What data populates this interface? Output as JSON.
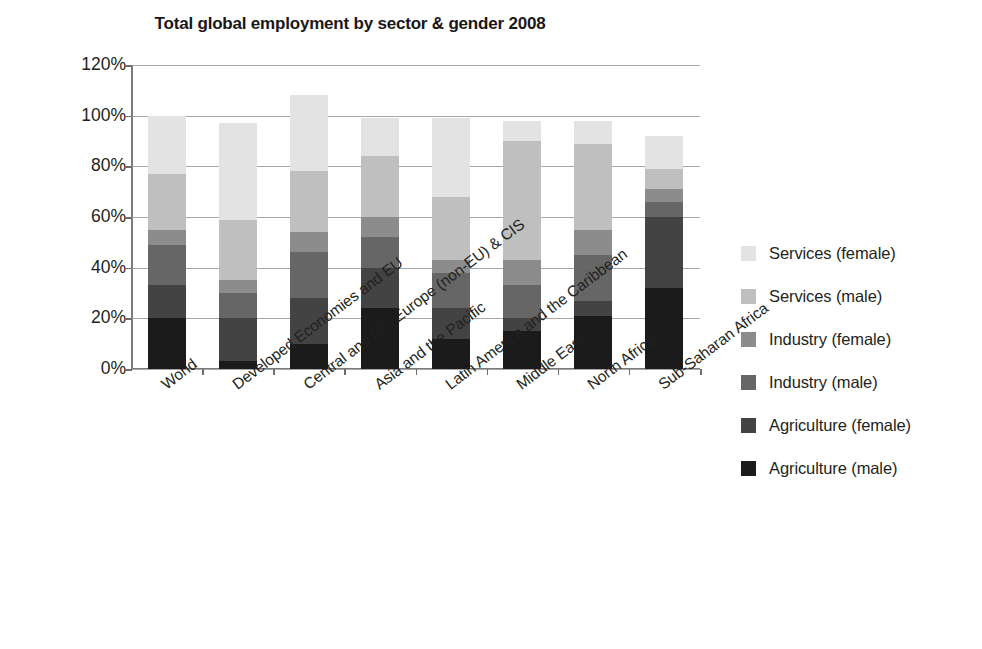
{
  "chart_data": {
    "type": "bar",
    "subtype": "stacked-bar-percent",
    "title": "Total global employment by sector & gender 2008",
    "xlabel": "",
    "ylabel": "",
    "ylim": [
      0,
      120
    ],
    "ytick_labels": [
      "0%",
      "20%",
      "40%",
      "60%",
      "80%",
      "100%",
      "120%"
    ],
    "ytick_values": [
      0,
      20,
      40,
      60,
      80,
      100,
      120
    ],
    "grid": true,
    "legend_position": "right",
    "stack_order_bottom_to_top": [
      "Agriculture (male)",
      "Agriculture (female)",
      "Industry (male)",
      "Industry (female)",
      "Services (male)",
      "Services (female)"
    ],
    "categories": [
      "World",
      "Developed Economies and EU",
      "Central and SE. Europe (non-EU) & CIS",
      "Asia and the Pacific",
      "Latin America and the Caribbean",
      "Middle East",
      "North Africa",
      "Sub-Saharan Africa"
    ],
    "series": [
      {
        "name": "Services (female)",
        "color": "#e3e3e3",
        "values": [
          23,
          38,
          30,
          15,
          31,
          8,
          9,
          13
        ]
      },
      {
        "name": "Services (male)",
        "color": "#bfbfbf",
        "values": [
          22,
          24,
          24,
          24,
          25,
          47,
          34,
          8
        ]
      },
      {
        "name": "Industry (female)",
        "color": "#8c8c8c",
        "values": [
          6,
          5,
          8,
          8,
          5,
          10,
          10,
          5
        ]
      },
      {
        "name": "Industry (male)",
        "color": "#666666",
        "values": [
          16,
          10,
          18,
          12,
          14,
          13,
          18,
          6
        ]
      },
      {
        "name": "Agriculture (female)",
        "color": "#434343",
        "values": [
          13,
          17,
          18,
          16,
          12,
          5,
          6,
          28
        ]
      },
      {
        "name": "Agriculture (male)",
        "color": "#1b1b1b",
        "values": [
          20,
          3,
          10,
          24,
          12,
          15,
          21,
          32
        ]
      }
    ],
    "bar_totals": [
      100,
      97,
      108,
      99,
      99,
      98,
      98,
      92
    ]
  },
  "legend": {
    "items": [
      {
        "label": "Services (female)",
        "swatch_color": "#e3e3e3",
        "swatch_name": "legend-swatch-services-female"
      },
      {
        "label": "Services (male)",
        "swatch_color": "#bfbfbf",
        "swatch_name": "legend-swatch-services-male"
      },
      {
        "label": "Industry (female)",
        "swatch_color": "#8c8c8c",
        "swatch_name": "legend-swatch-industry-female"
      },
      {
        "label": "Industry (male)",
        "swatch_color": "#666666",
        "swatch_name": "legend-swatch-industry-male"
      },
      {
        "label": "Agriculture (female)",
        "swatch_color": "#434343",
        "swatch_name": "legend-swatch-agriculture-female"
      },
      {
        "label": "Agriculture (male)",
        "swatch_color": "#1b1b1b",
        "swatch_name": "legend-swatch-agriculture-male"
      }
    ]
  },
  "colors": {
    "background": "#ffffff",
    "text": "#231f20",
    "grid": "#a6a6a6",
    "axis": "#7a7a7a"
  }
}
